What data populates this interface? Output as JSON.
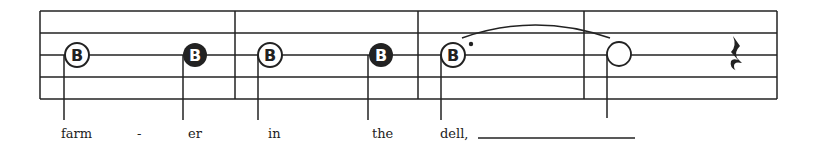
{
  "score": {
    "ink_color": "#222222",
    "staff": {
      "lines": 5,
      "left": 40,
      "right": 777,
      "top": 11,
      "spacing": 22
    },
    "barlines": [
      40,
      235,
      418,
      584,
      777
    ],
    "measures": [
      {
        "notes": [
          {
            "type": "half",
            "pitch": "B",
            "filled": false
          },
          {
            "type": "quarter",
            "pitch": "B",
            "filled": true
          }
        ]
      },
      {
        "notes": [
          {
            "type": "half",
            "pitch": "B",
            "filled": false
          },
          {
            "type": "quarter",
            "pitch": "B",
            "filled": true
          }
        ]
      },
      {
        "notes": [
          {
            "type": "dotted-half",
            "pitch": "B",
            "filled": false,
            "tied": true
          }
        ]
      },
      {
        "notes": [
          {
            "type": "half",
            "pitch": "",
            "filled": false,
            "tied_from_previous": true
          },
          {
            "type": "quarter-rest"
          }
        ]
      }
    ],
    "note_letter": "B"
  },
  "lyrics": {
    "syllables": [
      "farm",
      "-",
      "er",
      "in",
      "the",
      "dell,"
    ]
  }
}
